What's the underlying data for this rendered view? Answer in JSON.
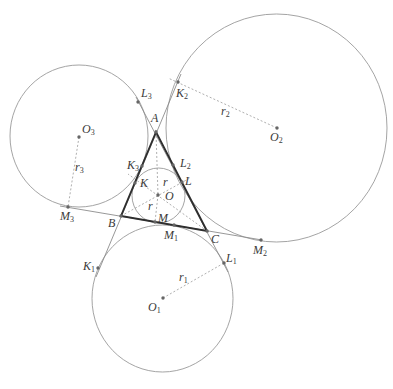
{
  "diagram": {
    "colors": {
      "background": "#ffffff",
      "circle": "#9a9a9a",
      "thin_line": "#8c8c8c",
      "dashed_line": "#9a9a9a",
      "triangle": "#2e2e2e",
      "point": "#666666"
    },
    "points": {
      "A": [
        156,
        132
      ],
      "B": [
        121,
        216
      ],
      "C": [
        207,
        231
      ],
      "K": [
        135,
        183
      ],
      "L": [
        182,
        182
      ],
      "M": [
        155,
        222
      ],
      "O": [
        158,
        195
      ],
      "K1": [
        98,
        268
      ],
      "K2": [
        178,
        82
      ],
      "K3": [
        142,
        166
      ],
      "L1": [
        224,
        263
      ],
      "L2": [
        173,
        165
      ],
      "L3": [
        138,
        102
      ],
      "M1": [
        174,
        225
      ],
      "M2": [
        261,
        240
      ],
      "M3": [
        68,
        207
      ],
      "O1": [
        163,
        298
      ],
      "O2": [
        277,
        128
      ],
      "O3": [
        79,
        137
      ]
    },
    "circles": [
      {
        "name": "incircle",
        "center": "O",
        "cx": 158.5,
        "cy": 195.5,
        "rx": 26.5,
        "ry": 27.5
      },
      {
        "name": "excircle-1",
        "center": "O1",
        "cx": 162.5,
        "cy": 298.5,
        "rx": 70.5,
        "ry": 73.5
      },
      {
        "name": "excircle-2",
        "center": "O2",
        "cx": 276.5,
        "cy": 128,
        "rx": 110.5,
        "ry": 114
      },
      {
        "name": "excircle-3",
        "center": "O3",
        "cx": 79,
        "cy": 136,
        "rx": 69,
        "ry": 71
      }
    ],
    "triangle": [
      "A",
      "B",
      "C"
    ],
    "thin_lines": [
      {
        "name": "line-AB-extended",
        "coords": [
          181,
          74,
          96,
          277
        ]
      },
      {
        "name": "line-AC-extended",
        "coords": [
          136,
          97,
          228,
          272
        ]
      },
      {
        "name": "line-BC-extended",
        "coords": [
          60,
          206,
          262,
          240
        ]
      }
    ],
    "dashed_lines": [
      {
        "name": "bisector-A",
        "coords": [
          156,
          132,
          158,
          195
        ]
      },
      {
        "name": "radius-OM",
        "coords": [
          158,
          195,
          155,
          222
        ]
      },
      {
        "name": "bisector-B",
        "coords": [
          121,
          216,
          190,
          178
        ]
      },
      {
        "name": "bisector-C",
        "coords": [
          207,
          231,
          128,
          174
        ]
      },
      {
        "name": "radius-r1",
        "coords": [
          163,
          298,
          224,
          263
        ]
      },
      {
        "name": "radius-r2",
        "coords": [
          277,
          128,
          168,
          78
        ]
      },
      {
        "name": "radius-r3",
        "coords": [
          79,
          137,
          68,
          207
        ]
      }
    ],
    "labels": {
      "A": {
        "main": "A"
      },
      "B": {
        "main": "B"
      },
      "C": {
        "main": "C"
      },
      "K": {
        "main": "K"
      },
      "L": {
        "main": "L"
      },
      "M": {
        "main": "M"
      },
      "O": {
        "main": "O"
      },
      "K1": {
        "main": "K",
        "sub": "1"
      },
      "K2": {
        "main": "K",
        "sub": "2"
      },
      "K3": {
        "main": "K",
        "sub": "3"
      },
      "L1": {
        "main": "L",
        "sub": "1"
      },
      "L2": {
        "main": "L",
        "sub": "2"
      },
      "L3": {
        "main": "L",
        "sub": "3"
      },
      "M1": {
        "main": "M",
        "sub": "1"
      },
      "M2": {
        "main": "M",
        "sub": "2"
      },
      "M3": {
        "main": "M",
        "sub": "3"
      },
      "O1": {
        "main": "O",
        "sub": "1"
      },
      "O2": {
        "main": "O",
        "sub": "2"
      },
      "O3": {
        "main": "O",
        "sub": "3"
      },
      "r_upper": {
        "main": "r"
      },
      "r_lower": {
        "main": "r"
      },
      "r1": {
        "main": "r",
        "sub": "1"
      },
      "r2": {
        "main": "r",
        "sub": "2"
      },
      "r3": {
        "main": "r",
        "sub": "3"
      }
    }
  }
}
